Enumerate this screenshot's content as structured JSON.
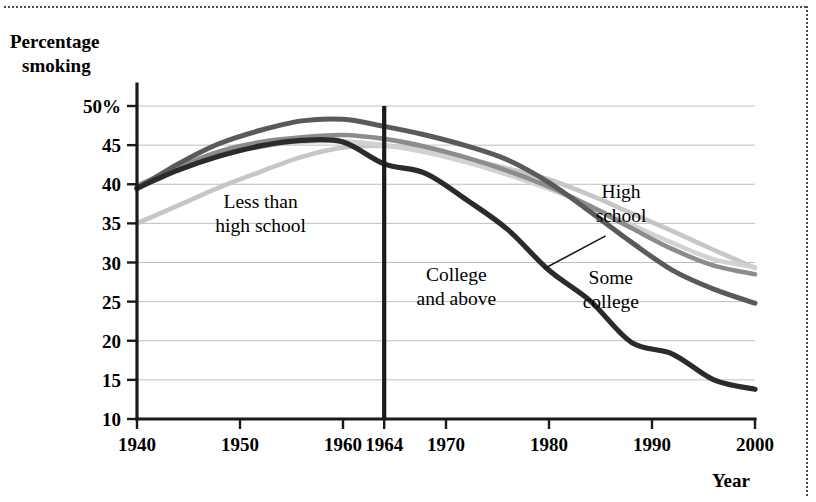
{
  "figure": {
    "name": "percentage-smoking-by-education-line-chart",
    "has_top_dotted_rule": true,
    "has_right_dotted_rule": true
  },
  "chart_data": {
    "type": "line",
    "title": "",
    "ylabel": "Percentage smoking",
    "xlabel": "Year",
    "ylabel_line1": "Percentage",
    "ylabel_line2": "smoking",
    "xlim": [
      1940,
      2000
    ],
    "ylim": [
      10,
      50
    ],
    "grid": true,
    "legend_position": "inline-annotations",
    "y_ticks": [
      10,
      15,
      20,
      25,
      30,
      35,
      40,
      45,
      50
    ],
    "y_tick_labels": [
      "10",
      "15",
      "20",
      "25",
      "30",
      "35",
      "40",
      "45",
      "50%"
    ],
    "x_ticks": [
      1940,
      1950,
      1960,
      1964,
      1970,
      1980,
      1990,
      2000
    ],
    "x_tick_labels": [
      "1940",
      "1950",
      "1960",
      "1964",
      "1970",
      "1980",
      "1990",
      "2000"
    ],
    "annotations": [
      {
        "name": "marker-1964",
        "type": "vline",
        "x": 1964,
        "label": "1964",
        "color": "#1a1a1a"
      }
    ],
    "series": [
      {
        "name": "Less than high school",
        "label_line1": "Less than",
        "label_line2": "high school",
        "color": "#c6c6c6",
        "width": 4.6,
        "label_x": 1952,
        "label_y": 37.0,
        "has_leader": false,
        "x": [
          1940,
          1944,
          1948,
          1952,
          1956,
          1960,
          1964,
          1968,
          1972,
          1976,
          1980,
          1984,
          1988,
          1992,
          1996,
          2000
        ],
        "y": [
          35.0,
          37.3,
          39.6,
          41.6,
          43.5,
          44.7,
          44.9,
          44.4,
          43.3,
          42.0,
          40.6,
          38.6,
          36.3,
          34.0,
          31.6,
          29.3
        ]
      },
      {
        "name": "High school",
        "label_line1": "High",
        "label_line2": "school",
        "color": "#d2d2d2",
        "width": 4.6,
        "label_x": 1987,
        "label_y": 38.2,
        "has_leader": true,
        "leader_from_x": 1985.5,
        "leader_from_y": 33.4,
        "leader_to_x": 1979.5,
        "leader_to_y": 29.2,
        "x": [
          1940,
          1944,
          1948,
          1952,
          1956,
          1960,
          1964,
          1968,
          1972,
          1976,
          1980,
          1984,
          1988,
          1992,
          1996,
          2000
        ],
        "y": [
          39.6,
          41.8,
          43.6,
          44.8,
          45.4,
          45.5,
          45.0,
          44.1,
          42.8,
          41.2,
          39.4,
          37.2,
          34.8,
          32.5,
          30.4,
          29.4
        ]
      },
      {
        "name": "Some college",
        "label_line1": "Some",
        "label_line2": "college",
        "color": "#8c8c8c",
        "width": 4.6,
        "label_x": 1986,
        "label_y": 27.2,
        "has_leader": false,
        "x": [
          1940,
          1944,
          1948,
          1952,
          1956,
          1960,
          1964,
          1968,
          1972,
          1976,
          1980,
          1984,
          1988,
          1992,
          1996,
          2000
        ],
        "y": [
          39.8,
          42.2,
          44.2,
          45.4,
          46.0,
          46.3,
          45.8,
          44.8,
          43.4,
          41.7,
          39.7,
          37.2,
          34.4,
          31.7,
          29.6,
          28.5
        ]
      },
      {
        "name": "College and above",
        "label_line1": "College",
        "label_line2": "and above",
        "color": "#5a5a5a",
        "width": 5.0,
        "label_x": 1971,
        "label_y": 27.6,
        "has_leader": false,
        "x": [
          1940,
          1944,
          1948,
          1952,
          1956,
          1960,
          1964,
          1968,
          1972,
          1976,
          1980,
          1984,
          1988,
          1992,
          1996,
          2000
        ],
        "y": [
          39.4,
          42.6,
          45.2,
          46.9,
          48.1,
          48.3,
          47.4,
          46.3,
          44.9,
          43.1,
          40.2,
          36.5,
          32.6,
          29.0,
          26.6,
          24.8
        ]
      },
      {
        "name": "College and above lowest",
        "label_line1": "",
        "label_line2": "",
        "color": "#2b2b2b",
        "width": 5.2,
        "label_x": 0,
        "label_y": 0,
        "has_leader": false,
        "x": [
          1940,
          1944,
          1948,
          1952,
          1956,
          1960,
          1964,
          1968,
          1972,
          1976,
          1980,
          1984,
          1988,
          1992,
          1996,
          2000
        ],
        "y": [
          39.5,
          41.8,
          43.6,
          44.9,
          45.6,
          45.4,
          42.6,
          41.4,
          38.0,
          34.2,
          29.0,
          25.1,
          19.8,
          18.3,
          15.0,
          13.8
        ]
      }
    ]
  }
}
